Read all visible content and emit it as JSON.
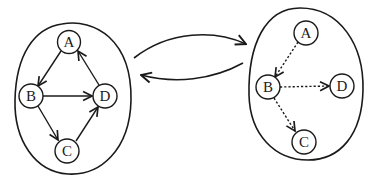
{
  "diagram": {
    "left_graph": {
      "edge_style": "solid",
      "nodes": [
        {
          "id": "A",
          "label": "A",
          "cx": 69,
          "cy": 42
        },
        {
          "id": "B",
          "label": "B",
          "cx": 31,
          "cy": 96
        },
        {
          "id": "D",
          "label": "D",
          "cx": 105,
          "cy": 96
        },
        {
          "id": "C",
          "label": "C",
          "cx": 67,
          "cy": 151
        }
      ],
      "edges": [
        {
          "from": "A",
          "to": "B"
        },
        {
          "from": "B",
          "to": "D"
        },
        {
          "from": "B",
          "to": "C"
        },
        {
          "from": "C",
          "to": "D"
        },
        {
          "from": "D",
          "to": "A"
        }
      ]
    },
    "right_graph": {
      "edge_style": "dashed",
      "nodes": [
        {
          "id": "A",
          "label": "A",
          "cx": 306,
          "cy": 33
        },
        {
          "id": "B",
          "label": "B",
          "cx": 268,
          "cy": 87
        },
        {
          "id": "D",
          "label": "D",
          "cx": 342,
          "cy": 86
        },
        {
          "id": "C",
          "label": "C",
          "cx": 304,
          "cy": 142
        }
      ],
      "edges": [
        {
          "from": "A",
          "to": "B"
        },
        {
          "from": "B",
          "to": "D"
        },
        {
          "from": "B",
          "to": "C"
        }
      ]
    },
    "connectors": [
      {
        "direction": "left-to-right",
        "from": "left_graph",
        "to": "right_graph"
      },
      {
        "direction": "right-to-left",
        "from": "right_graph",
        "to": "left_graph"
      }
    ],
    "labels": {
      "left_A": "A",
      "left_B": "B",
      "left_C": "C",
      "left_D": "D",
      "right_A": "A",
      "right_B": "B",
      "right_C": "C",
      "right_D": "D"
    },
    "colors": {
      "stroke": "#1a1a1a",
      "background": "#ffffff"
    }
  }
}
